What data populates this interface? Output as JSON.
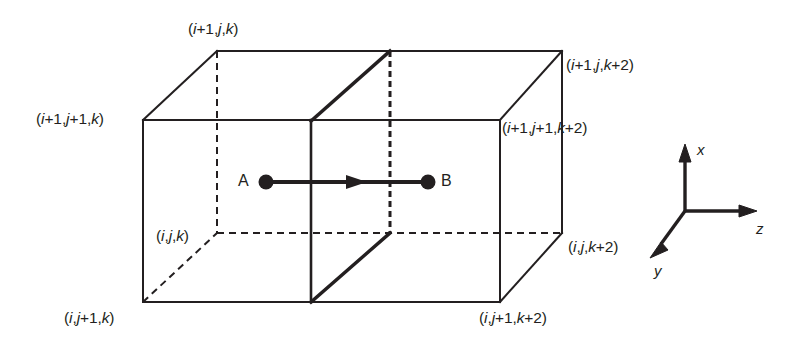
{
  "figure": {
    "kind": "3d-grid-cell-diagram",
    "background_color": "#ffffff",
    "stroke_color": "#231f20"
  },
  "vertex_labels": {
    "top_back_left": "(i+1,j,k)",
    "top_front_left": "(i+1,j+1,k)",
    "top_back_right": "(i+1,j,k+2)",
    "top_front_right": "(i+1,j+1,k+2)",
    "bottom_back_left": "(i,j,k)",
    "bottom_front_left": "(i,j+1,k)",
    "bottom_back_right": "(i,j,k+2)",
    "bottom_front_right": "(i,j+1,k+2)"
  },
  "points": {
    "a_label": "A",
    "b_label": "B"
  },
  "axes": {
    "x_label": "x",
    "y_label": "y",
    "z_label": "z"
  }
}
